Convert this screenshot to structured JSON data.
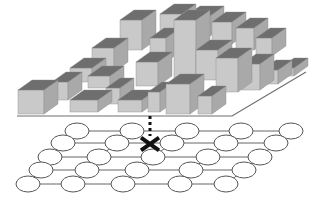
{
  "figure": {
    "colors": {
      "background": "#ffffff",
      "bar_top": "#6e6e6e",
      "bar_front": "#c9c9c9",
      "bar_side": "#a9a9a9",
      "bar_edge": "#8a8a8a",
      "platform_line": "#6f6f6f",
      "node_fill": "#ffffff",
      "node_stroke": "#555555",
      "edge_stroke": "#666666",
      "marker": "#111111"
    },
    "histogram": {
      "depth_dx": 14,
      "depth_dy": -10,
      "baseline": [
        [
          17,
          116
        ],
        [
          232,
          116
        ],
        [
          306,
          72
        ]
      ],
      "bars": [
        {
          "x": 186,
          "base": 36,
          "w": 24,
          "h": 20
        },
        {
          "x": 160,
          "base": 40,
          "w": 22,
          "h": 26
        },
        {
          "x": 120,
          "base": 50,
          "w": 22,
          "h": 30
        },
        {
          "x": 212,
          "base": 44,
          "w": 20,
          "h": 22
        },
        {
          "x": 236,
          "base": 50,
          "w": 18,
          "h": 22
        },
        {
          "x": 256,
          "base": 56,
          "w": 16,
          "h": 18
        },
        {
          "x": 150,
          "base": 62,
          "w": 16,
          "h": 24
        },
        {
          "x": 92,
          "base": 72,
          "w": 22,
          "h": 24
        },
        {
          "x": 174,
          "base": 80,
          "w": 22,
          "h": 60
        },
        {
          "x": 196,
          "base": 80,
          "w": 22,
          "h": 30
        },
        {
          "x": 136,
          "base": 86,
          "w": 22,
          "h": 24
        },
        {
          "x": 70,
          "base": 82,
          "w": 22,
          "h": 14
        },
        {
          "x": 88,
          "base": 88,
          "w": 22,
          "h": 12
        },
        {
          "x": 216,
          "base": 92,
          "w": 22,
          "h": 34
        },
        {
          "x": 242,
          "base": 90,
          "w": 18,
          "h": 26
        },
        {
          "x": 262,
          "base": 84,
          "w": 16,
          "h": 14
        },
        {
          "x": 280,
          "base": 76,
          "w": 14,
          "h": 8
        },
        {
          "x": 52,
          "base": 100,
          "w": 16,
          "h": 18
        },
        {
          "x": 18,
          "base": 114,
          "w": 26,
          "h": 24
        },
        {
          "x": 70,
          "base": 112,
          "w": 28,
          "h": 12
        },
        {
          "x": 118,
          "base": 112,
          "w": 24,
          "h": 12
        },
        {
          "x": 166,
          "base": 114,
          "w": 24,
          "h": 30
        },
        {
          "x": 198,
          "base": 114,
          "w": 14,
          "h": 18
        },
        {
          "x": 148,
          "base": 112,
          "w": 12,
          "h": 20
        },
        {
          "x": 106,
          "base": 104,
          "w": 14,
          "h": 16
        }
      ]
    },
    "graph": {
      "node_rx": 12,
      "node_ry": 8,
      "rows": [
        {
          "y": 131,
          "xs": [
            77,
            132,
            187,
            241,
            291
          ]
        },
        {
          "y": 143,
          "xs": [
            63,
            117,
            172,
            226,
            276
          ]
        },
        {
          "y": 157,
          "xs": [
            50,
            99,
            153,
            208,
            260
          ]
        },
        {
          "y": 170,
          "xs": [
            41,
            87,
            137,
            191,
            244
          ]
        },
        {
          "y": 184,
          "xs": [
            28,
            73,
            123,
            180,
            226
          ]
        }
      ],
      "marked_node": {
        "x": 150,
        "y": 144,
        "size": 9
      },
      "dotted_line": {
        "x": 150,
        "y1": 116,
        "y2": 136
      }
    }
  }
}
